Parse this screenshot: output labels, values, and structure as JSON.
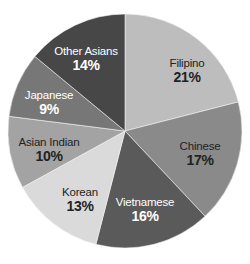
{
  "chart_data": {
    "type": "pie",
    "title": "",
    "start_angle_deg": 0,
    "direction": "clockwise",
    "center": [
      125,
      131
    ],
    "radius": 117,
    "categories": [
      "Filipino",
      "Chinese",
      "Vietnamese",
      "Korean",
      "Asian Indian",
      "Japanese",
      "Other Asians"
    ],
    "values": [
      21,
      17,
      16,
      13,
      10,
      9,
      14
    ],
    "units": "%",
    "slices": [
      {
        "label": "Filipino",
        "value": 21,
        "pct_label": "21%",
        "color": "#bdbdbd",
        "text_color": "#222222",
        "label_pos": [
          187,
          67
        ]
      },
      {
        "label": "Chinese",
        "value": 17,
        "pct_label": "17%",
        "color": "#8a8a8a",
        "text_color": "#222222",
        "label_pos": [
          200,
          150
        ]
      },
      {
        "label": "Vietnamese",
        "value": 16,
        "pct_label": "16%",
        "color": "#5a5a5a",
        "text_color": "#ffffff",
        "label_pos": [
          145,
          206
        ]
      },
      {
        "label": "Korean",
        "value": 13,
        "pct_label": "13%",
        "color": "#dadada",
        "text_color": "#222222",
        "label_pos": [
          80,
          196
        ]
      },
      {
        "label": "Asian Indian",
        "value": 10,
        "pct_label": "10%",
        "color": "#a3a3a3",
        "text_color": "#222222",
        "label_pos": [
          49,
          146
        ]
      },
      {
        "label": "Japanese",
        "value": 9,
        "pct_label": "9%",
        "color": "#777777",
        "text_color": "#ffffff",
        "label_pos": [
          49,
          99
        ]
      },
      {
        "label": "Other Asians",
        "value": 14,
        "pct_label": "14%",
        "color": "#474747",
        "text_color": "#ffffff",
        "label_pos": [
          86,
          55
        ]
      }
    ],
    "legend": null,
    "grid": false
  }
}
